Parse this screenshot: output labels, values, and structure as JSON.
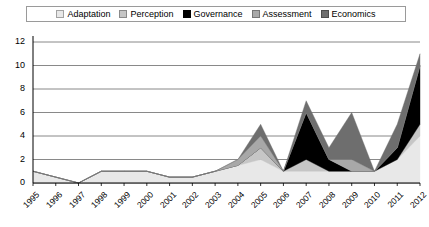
{
  "legend": {
    "position": "top",
    "items": [
      {
        "label": "Adaptation",
        "color": "#e8e8e8",
        "icon": "legend-swatch-icon"
      },
      {
        "label": "Perception",
        "color": "#c6c6c6",
        "icon": "legend-swatch-icon"
      },
      {
        "label": "Governance",
        "color": "#000000",
        "icon": "legend-swatch-icon"
      },
      {
        "label": "Assessment",
        "color": "#a8a8a8",
        "icon": "legend-swatch-icon"
      },
      {
        "label": "Economics",
        "color": "#6e6e6e",
        "icon": "legend-swatch-icon"
      }
    ]
  },
  "axes": {
    "y_ticks": [
      "0",
      "2",
      "4",
      "6",
      "8",
      "10",
      "12"
    ],
    "x_ticks": [
      "1995",
      "1996",
      "1997",
      "1998",
      "1999",
      "2000",
      "2001",
      "2002",
      "2003",
      "2004",
      "2005",
      "2006",
      "2007",
      "2008",
      "2009",
      "2010",
      "2011",
      "2012"
    ]
  },
  "chart_data": {
    "type": "area",
    "stacked": true,
    "title": "",
    "xlabel": "",
    "ylabel": "",
    "ylim": [
      0,
      12
    ],
    "ytick_step": 2,
    "grid": true,
    "legend_position": "top",
    "categories": [
      "1995",
      "1996",
      "1997",
      "1998",
      "1999",
      "2000",
      "2001",
      "2002",
      "2003",
      "2004",
      "2005",
      "2006",
      "2007",
      "2008",
      "2009",
      "2010",
      "2011",
      "2012"
    ],
    "series": [
      {
        "name": "Adaptation",
        "color": "#e8e8e8",
        "values": [
          1,
          0.5,
          0,
          1,
          1,
          1,
          0.5,
          0.5,
          1,
          1.5,
          2,
          1,
          1,
          1,
          1,
          1,
          2,
          4
        ]
      },
      {
        "name": "Perception",
        "color": "#c6c6c6",
        "values": [
          0,
          0,
          0,
          0,
          0,
          0,
          0,
          0,
          0,
          0,
          1,
          0,
          1,
          0,
          0,
          0,
          0,
          1
        ]
      },
      {
        "name": "Governance",
        "color": "#000000",
        "values": [
          0,
          0,
          0,
          0,
          0,
          0,
          0,
          0,
          0,
          0,
          0,
          0,
          4,
          1,
          0,
          0,
          1,
          5
        ]
      },
      {
        "name": "Assessment",
        "color": "#a8a8a8",
        "values": [
          0,
          0,
          0,
          0,
          0,
          0,
          0,
          0,
          0,
          0.5,
          1,
          0,
          0,
          0,
          1,
          0,
          0,
          0
        ]
      },
      {
        "name": "Economics",
        "color": "#6e6e6e",
        "values": [
          0,
          0,
          0,
          0,
          0,
          0,
          0,
          0,
          0,
          0,
          1,
          0,
          1,
          1,
          4,
          0,
          2,
          1
        ]
      }
    ],
    "totals": [
      1,
      0.5,
      0,
      1,
      1,
      1,
      0.5,
      0.5,
      1,
      2,
      5,
      1,
      7,
      3,
      6,
      1,
      5,
      11
    ]
  }
}
